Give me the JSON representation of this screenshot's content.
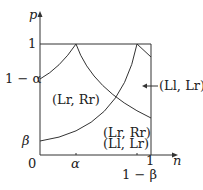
{
  "axes": {
    "y_label": "p",
    "x_label": "n",
    "y_ticks": [
      {
        "label": "1",
        "value": "1"
      },
      {
        "label": "1 − α",
        "value": "1-alpha"
      },
      {
        "label": "β",
        "value": "beta"
      }
    ],
    "x_ticks": [
      {
        "label": "0",
        "value": "0"
      },
      {
        "label": "α",
        "value": "alpha"
      },
      {
        "label": "1",
        "value": "1"
      },
      {
        "label": "1 − β",
        "value": "1-beta"
      }
    ]
  },
  "regions": {
    "upper_left": "(Lr, Rr)",
    "lower_right_line1": "(Lr, Rr)",
    "lower_right_line2": "(Ll, Lr)",
    "right_arrow": "(Ll, Lr)"
  },
  "colors": {
    "line": "#333333",
    "background": "#ffffff"
  }
}
